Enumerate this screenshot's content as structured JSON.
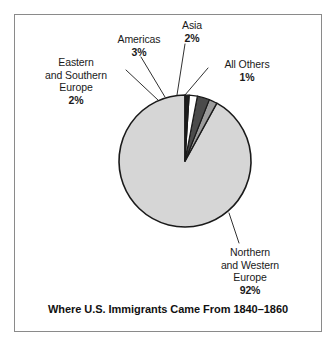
{
  "figure": {
    "title": "Where U.S. Immigrants Came From 1840–1860",
    "frame_color": "#8a8a8a",
    "background": "#ffffff"
  },
  "labels": {
    "eastern_southern_europe": {
      "line1": "Eastern",
      "line2": "and Southern",
      "line3": "Europe",
      "percent": "2%"
    },
    "americas": {
      "line1": "Americas",
      "percent": "3%"
    },
    "asia": {
      "line1": "Asia",
      "percent": "2%"
    },
    "all_others": {
      "line1": "All Others",
      "percent": "1%"
    },
    "northern_western_europe": {
      "line1": "Northern",
      "line2": "and Western",
      "line3": "Europe",
      "percent": "92%"
    }
  },
  "chart_data": {
    "type": "pie",
    "title": "Where U.S. Immigrants Came From 1840–1860",
    "xlabel": "",
    "ylabel": "",
    "legend_position": "callout-labels",
    "grid": false,
    "units": "percent",
    "total": 100,
    "start_angle_deg": 90,
    "direction": "counterclockwise",
    "center_px": [
      185,
      161
    ],
    "radius_px": 66,
    "categories": [
      "Northern and Western Europe",
      "Eastern and Southern Europe",
      "Americas",
      "Asia",
      "All Others"
    ],
    "values": [
      92,
      2,
      3,
      2,
      1
    ],
    "slices": [
      {
        "label": "Northern and Western Europe",
        "value": 92,
        "display": "92%",
        "color": "#d6d6d6",
        "stroke": "#1a1a1a"
      },
      {
        "label": "Eastern and Southern Europe",
        "value": 2,
        "display": "2%",
        "color": "#9c9c9c",
        "stroke": "#1a1a1a"
      },
      {
        "label": "Americas",
        "value": 3,
        "display": "3%",
        "color": "#4b4b4b",
        "stroke": "#1a1a1a"
      },
      {
        "label": "Asia",
        "value": 2,
        "display": "2%",
        "color": "#ffffff",
        "stroke": "#1a1a1a"
      },
      {
        "label": "All Others",
        "value": 1,
        "display": "1%",
        "color": "#1d1d1d",
        "stroke": "#1a1a1a"
      }
    ]
  }
}
